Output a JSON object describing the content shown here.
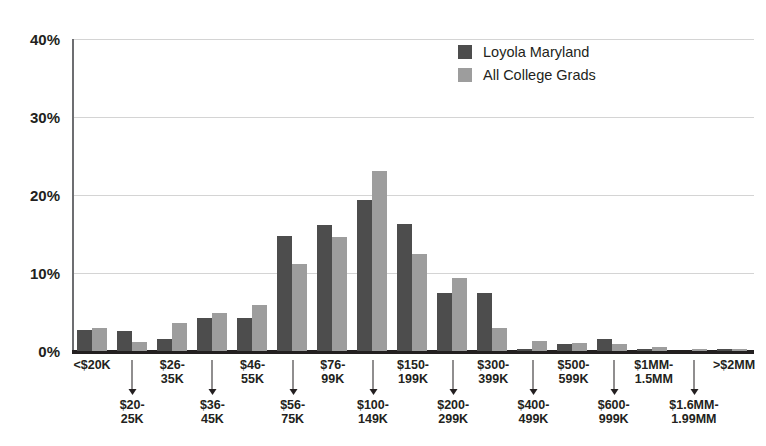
{
  "chart_data": {
    "type": "bar",
    "title": "",
    "xlabel": "",
    "ylabel": "",
    "ylim": [
      0,
      40
    ],
    "ytick_labels": [
      "40%",
      "30%",
      "20%",
      "10%",
      "0%"
    ],
    "ytick_values": [
      40,
      30,
      20,
      10,
      0
    ],
    "grid": true,
    "legend_position": "top-center-right",
    "categories": [
      "<$20K",
      "$20-25K",
      "$26-35K",
      "$36-45K",
      "$46-55K",
      "$56-75K",
      "$76-99K",
      "$100-149K",
      "$150-199K",
      "$200-299K",
      "$300-399K",
      "$400-499K",
      "$500-599K",
      "$600-999K",
      "$1MM-1.5MM",
      "$1.6MM-1.99MM",
      ">$2MM"
    ],
    "category_labels_top": [
      "<$20K",
      "$26-\n35K",
      "$46-\n55K",
      "$76-\n99K",
      "$150-\n199K",
      "$300-\n399K",
      "$500-\n599K",
      "$1MM-\n1.5MM",
      ">$2MM"
    ],
    "series": [
      {
        "name": "Loyola Maryland",
        "color": "#4d4d4d",
        "values": [
          2.7,
          2.6,
          1.5,
          4.2,
          4.2,
          14.7,
          16.2,
          19.4,
          16.3,
          7.5,
          7.5,
          0.3,
          0.9,
          1.5,
          0.2,
          0.0,
          0.2
        ]
      },
      {
        "name": "All College Grads",
        "color": "#9d9d9d",
        "values": [
          2.9,
          1.1,
          3.6,
          4.9,
          5.9,
          11.2,
          14.6,
          23.1,
          12.4,
          9.4,
          3.0,
          1.3,
          1.0,
          0.9,
          0.5,
          0.2,
          0.2
        ]
      }
    ]
  },
  "legend": {
    "items": [
      {
        "label": "Loyola Maryland",
        "swatch": "dark"
      },
      {
        "label": "All College Grads",
        "swatch": "light"
      }
    ]
  },
  "axis": {
    "y_ticks": [
      {
        "label": "40%",
        "value": 40
      },
      {
        "label": "30%",
        "value": 30
      },
      {
        "label": "20%",
        "value": 20
      },
      {
        "label": "10%",
        "value": 10
      },
      {
        "label": "0%",
        "value": 0
      }
    ],
    "x_cells": [
      {
        "position": "top",
        "line1": "<$20K",
        "line2": ""
      },
      {
        "position": "bottom",
        "line1": "$20-",
        "line2": "25K"
      },
      {
        "position": "top",
        "line1": "$26-",
        "line2": "35K"
      },
      {
        "position": "bottom",
        "line1": "$36-",
        "line2": "45K"
      },
      {
        "position": "top",
        "line1": "$46-",
        "line2": "55K"
      },
      {
        "position": "bottom",
        "line1": "$56-",
        "line2": "75K"
      },
      {
        "position": "top",
        "line1": "$76-",
        "line2": "99K"
      },
      {
        "position": "bottom",
        "line1": "$100-",
        "line2": "149K"
      },
      {
        "position": "top",
        "line1": "$150-",
        "line2": "199K"
      },
      {
        "position": "bottom",
        "line1": "$200-",
        "line2": "299K"
      },
      {
        "position": "top",
        "line1": "$300-",
        "line2": "399K"
      },
      {
        "position": "bottom",
        "line1": "$400-",
        "line2": "499K"
      },
      {
        "position": "top",
        "line1": "$500-",
        "line2": "599K"
      },
      {
        "position": "bottom",
        "line1": "$600-",
        "line2": "999K"
      },
      {
        "position": "top",
        "line1": "$1MM-",
        "line2": "1.5MM"
      },
      {
        "position": "bottom",
        "line1": "$1.6MM-",
        "line2": "1.99MM"
      },
      {
        "position": "top",
        "line1": ">$2MM",
        "line2": ""
      }
    ]
  }
}
